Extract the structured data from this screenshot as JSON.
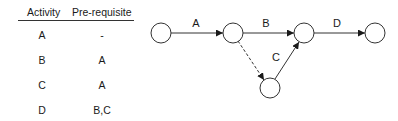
{
  "table": {
    "headers": {
      "activity": "Activity",
      "prerequisite": "Pre-requisite"
    },
    "rows": [
      {
        "activity": "A",
        "prerequisite": "-"
      },
      {
        "activity": "B",
        "prerequisite": "A"
      },
      {
        "activity": "C",
        "prerequisite": "A"
      },
      {
        "activity": "D",
        "prerequisite": "B,C"
      }
    ]
  },
  "network": {
    "nodes": [
      {
        "id": "n1",
        "x": 161,
        "y": 33,
        "r": 10
      },
      {
        "id": "n2",
        "x": 233,
        "y": 33,
        "r": 10
      },
      {
        "id": "n3",
        "x": 304,
        "y": 33,
        "r": 10
      },
      {
        "id": "n4",
        "x": 375,
        "y": 33,
        "r": 10
      },
      {
        "id": "n5",
        "x": 270,
        "y": 88,
        "r": 10
      }
    ],
    "edges": [
      {
        "id": "A",
        "label": "A",
        "from": "n1",
        "to": "n2",
        "style": "solid"
      },
      {
        "id": "B",
        "label": "B",
        "from": "n2",
        "to": "n3",
        "style": "solid"
      },
      {
        "id": "dummy",
        "label": "",
        "from": "n2",
        "to": "n5",
        "style": "dashed"
      },
      {
        "id": "C",
        "label": "C",
        "from": "n5",
        "to": "n3",
        "style": "solid"
      },
      {
        "id": "D",
        "label": "D",
        "from": "n3",
        "to": "n4",
        "style": "solid"
      }
    ],
    "colors": {
      "stroke": "#333333",
      "fill": "#ffffff"
    }
  }
}
